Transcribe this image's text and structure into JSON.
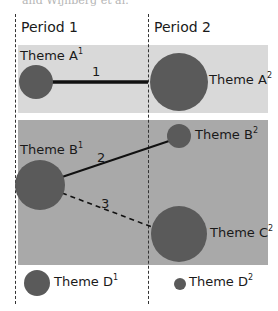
{
  "top_fragment": "and Wijnberg et al.",
  "periods": [
    {
      "label": "Period 1"
    },
    {
      "label": "Period 2"
    }
  ],
  "themes": [
    {
      "name": "Theme A",
      "sup": "1",
      "period": 1,
      "size": "medium"
    },
    {
      "name": "Theme A",
      "sup": "2",
      "period": 2,
      "size": "large"
    },
    {
      "name": "Theme B",
      "sup": "1",
      "period": 1,
      "size": "large"
    },
    {
      "name": "Theme B",
      "sup": "2",
      "period": 2,
      "size": "small"
    },
    {
      "name": "Theme C",
      "sup": "2",
      "period": 2,
      "size": "large"
    },
    {
      "name": "Theme D",
      "sup": "1",
      "period": 1,
      "size": "small"
    },
    {
      "name": "Theme D",
      "sup": "2",
      "period": 2,
      "size": "very-small"
    }
  ],
  "edges": [
    {
      "label": "1",
      "from": "Theme A1",
      "to": "Theme A2",
      "style": "thick-solid"
    },
    {
      "label": "2",
      "from": "Theme B1",
      "to": "Theme B2",
      "style": "solid"
    },
    {
      "label": "3",
      "from": "Theme B1",
      "to": "Theme C2",
      "style": "dashed"
    }
  ],
  "colors": {
    "band_a": "#d9d9d9",
    "band_bc": "#a9a9a9",
    "node": "#5a5a5a",
    "line": "#111111"
  }
}
